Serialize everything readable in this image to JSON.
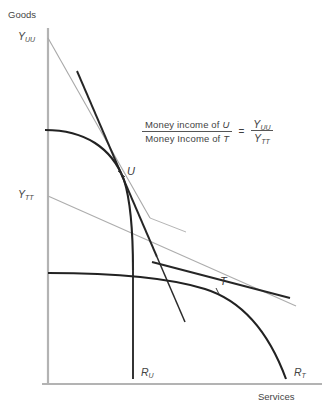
{
  "figure": {
    "axes": {
      "y_axis_title": "Goods",
      "x_axis_title": "Services"
    },
    "axis_intercepts": {
      "y_uu": "Y",
      "y_uu_sub": "UU",
      "y_tt": "Y",
      "y_tt_sub": "TT",
      "r_u": "R",
      "r_u_sub": "U",
      "r_t": "R",
      "r_t_sub": "T"
    },
    "points": [
      {
        "label": "U",
        "x": 122,
        "y": 173
      },
      {
        "label": "T",
        "x": 218,
        "y": 285
      }
    ],
    "formula": {
      "numerator": "Money income of ",
      "numerator_italic": "U",
      "denominator": "Money Income of ",
      "denominator_italic": "T",
      "equals": "=",
      "rhs_numerator": "Y",
      "rhs_numerator_sub": "UU",
      "rhs_denominator": "Y",
      "rhs_denominator_sub": "TT"
    },
    "colors": {
      "axis": "#b0b0b0",
      "curve_dark": "#2b2b2b",
      "line_gray": "#a6a6a6",
      "text": "#444444"
    },
    "geometry": {
      "origin": {
        "x": 48,
        "y": 385
      },
      "y_axis_top": 28,
      "x_axis_right": 320,
      "uu_line_start": {
        "x": 48,
        "y": 38
      },
      "tt_line_start": {
        "x": 48,
        "y": 196
      },
      "u_curve_start": {
        "x": 45,
        "y": 130
      },
      "t_curve_start": {
        "x": 48,
        "y": 273
      },
      "r_u_foot": {
        "x": 133,
        "y": 378
      },
      "r_t_foot": {
        "x": 288,
        "y": 378
      }
    }
  }
}
